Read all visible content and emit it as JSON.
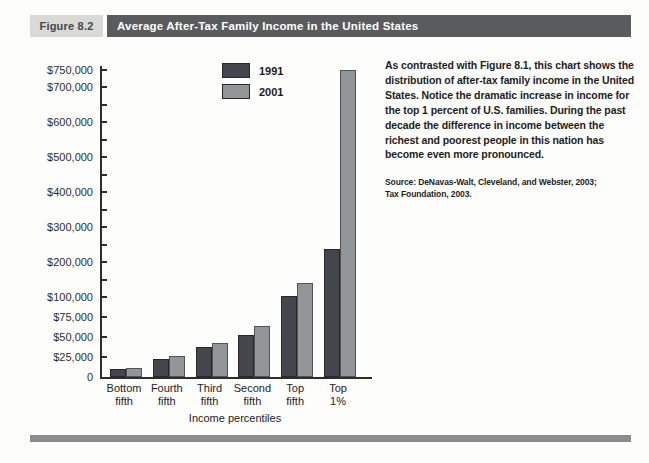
{
  "header": {
    "figure_label": "Figure 8.2",
    "title": "Average After-Tax Family Income in the United States"
  },
  "description": {
    "paragraph": "As contrasted with Figure 8.1, this chart shows the distribution of after-tax family income in the United States. Notice the dramatic increase in income for the top 1 percent of U.S. families. During the past decade the difference in income between the richest and poorest people in this nation has become even more pronounced.",
    "source_line1": "Source: DeNavas-Walt, Cleveland, and Webster, 2003;",
    "source_line2": "Tax Foundation, 2003."
  },
  "colors": {
    "title_bar_bg": "#595b5d",
    "figure_label_bg": "#d9d9d6",
    "series_1991": "#43474b",
    "series_1991_border": "#26282b",
    "series_2001": "#939699",
    "series_2001_border": "#515356",
    "bottom_rule": "#8c8c8c"
  },
  "chart_data": {
    "type": "bar",
    "title": "",
    "xlabel": "Income percentiles",
    "ylabel": "",
    "legend_position": "top-center-inside-plot",
    "grid": false,
    "categories": [
      {
        "label": "Bottom fifth",
        "line1": "Bottom",
        "line2": "fifth"
      },
      {
        "label": "Fourth fifth",
        "line1": "Fourth",
        "line2": "fifth"
      },
      {
        "label": "Third fifth",
        "line1": "Third",
        "line2": "fifth"
      },
      {
        "label": "Second fifth",
        "line1": "Second",
        "line2": "fifth"
      },
      {
        "label": "Top fifth",
        "line1": "Top",
        "line2": "fifth"
      },
      {
        "label": "Top 1%",
        "line1": "Top",
        "line2": "1%"
      }
    ],
    "series": [
      {
        "name": "1991",
        "color": "#43474b",
        "border": "#26282b",
        "values": [
          10000,
          23000,
          37500,
          52500,
          103000,
          237000
        ]
      },
      {
        "name": "2001",
        "color": "#939699",
        "border": "#515356",
        "values": [
          11500,
          26500,
          43000,
          64000,
          140000,
          755000
        ]
      }
    ],
    "y_axis": {
      "note": "piecewise-linear scale: 0-100,000 expanded, 100,000-750,000 compressed",
      "segments": [
        {
          "from": 0,
          "to": 100000,
          "px": 80
        },
        {
          "from": 100000,
          "to": 750000,
          "px": 227.5
        }
      ],
      "major_ticks": [
        {
          "value": 0,
          "label": "0"
        },
        {
          "value": 25000,
          "label": "$25,000"
        },
        {
          "value": 50000,
          "label": "$50,000"
        },
        {
          "value": 75000,
          "label": "$75,000"
        },
        {
          "value": 100000,
          "label": "$100,000"
        },
        {
          "value": 200000,
          "label": "$200,000"
        },
        {
          "value": 300000,
          "label": "$300,000"
        },
        {
          "value": 400000,
          "label": "$400,000"
        },
        {
          "value": 500000,
          "label": "$500,000"
        },
        {
          "value": 600000,
          "label": "$600,000"
        },
        {
          "value": 700000,
          "label": "$700,000"
        },
        {
          "value": 750000,
          "label": "$750,000"
        }
      ],
      "minor_ticks": [
        150000,
        250000,
        350000,
        450000,
        550000,
        650000
      ]
    }
  }
}
